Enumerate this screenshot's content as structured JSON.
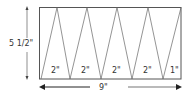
{
  "diagram": {
    "height_label": "5 1/2\"",
    "width_label": "9\"",
    "segments": [
      {
        "label": "2\""
      },
      {
        "label": "2\""
      },
      {
        "label": "2\""
      },
      {
        "label": "2\""
      },
      {
        "label": "1\""
      }
    ],
    "colors": {
      "stroke": "#555555",
      "arrow": "#222222",
      "arrow_right": "#777777"
    }
  }
}
